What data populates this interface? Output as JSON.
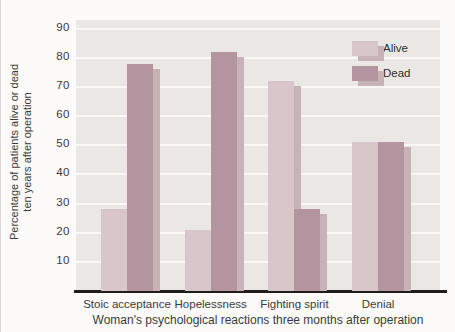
{
  "figure_title": "Bar chart: survival ten years after operation by psychological reaction",
  "y_axis": {
    "title_line1": "Percentage of patients alive or dead",
    "title_line2": "ten years after operation",
    "ticks": [
      "90",
      "80",
      "70",
      "60",
      "50",
      "40",
      "30",
      "20",
      "10"
    ]
  },
  "x_axis": {
    "title": "Woman's psychological reactions three months after operation"
  },
  "legend": {
    "items": [
      {
        "label": "Alive",
        "color": "#d8c6ca"
      },
      {
        "label": "Dead",
        "color": "#b4949f"
      }
    ]
  },
  "colors": {
    "alive": "#d8c6ca",
    "dead": "#b4949f",
    "bar_shadow": "#c7b2b8",
    "plot_background": "#ebe7e5",
    "gridline": "#faf8f7",
    "axis": "#1f1d1c"
  },
  "chart_data": {
    "type": "bar",
    "categories": [
      "Stoic acceptance",
      "Hopelessness",
      "Fighting spirit",
      "Denial"
    ],
    "series": [
      {
        "name": "Alive",
        "values": [
          28,
          21,
          72,
          51
        ]
      },
      {
        "name": "Dead",
        "values": [
          78,
          82,
          28,
          51
        ]
      }
    ],
    "title": "",
    "xlabel": "Woman's psychological reactions three months after operation",
    "ylabel": "Percentage of patients alive or dead ten years after operation",
    "ylim": [
      0,
      93
    ],
    "yticks": [
      10,
      20,
      30,
      40,
      50,
      60,
      70,
      80,
      90
    ],
    "grid": true,
    "legend_position": "top-right",
    "bar_style": "paired bars with offset drop-shadow copies"
  }
}
